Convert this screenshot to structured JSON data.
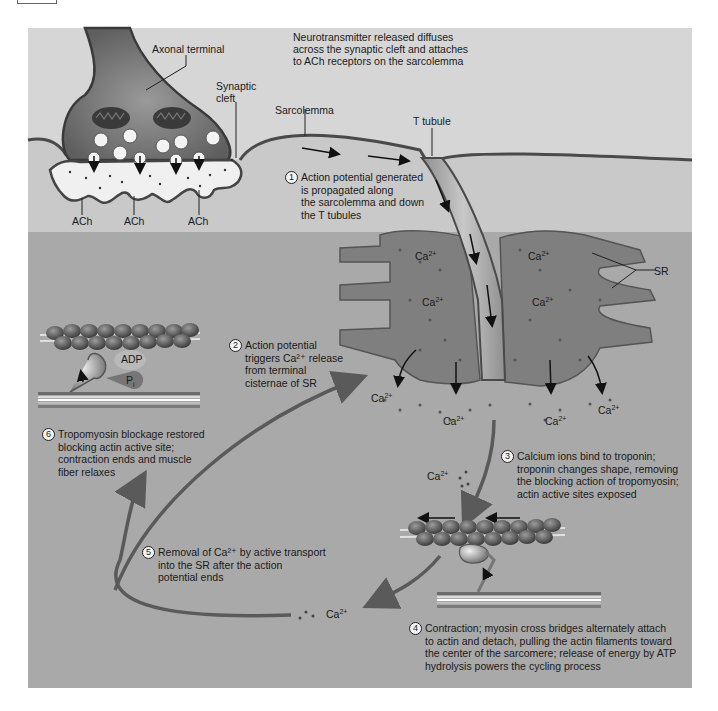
{
  "figure": {
    "colors": {
      "extracellular": "#d6d6d6",
      "cytoplasm": "#a9a9a9",
      "axon": "#6e6e6e",
      "sr": "#7a7a7a",
      "membrane": "#4a4a4a",
      "cycle_arrow": "#5a5a5a",
      "text": "#1a1a1a"
    }
  },
  "labels": {
    "axonal_terminal": "Axonal terminal",
    "synaptic_cleft_1": "Synaptic",
    "synaptic_cleft_2": "cleft",
    "sarcolemma": "Sarcolemma",
    "t_tubule": "T tubule",
    "sr": "SR",
    "ach": [
      "ACh",
      "ACh",
      "ACh"
    ],
    "adp": "ADP",
    "pi": "P",
    "pi_sub": "i",
    "ca": "Ca",
    "ca_charge": "2+"
  },
  "neurotransmitter_note": [
    "Neurotransmitter released diffuses",
    "across the synaptic cleft and attaches",
    "to ACh receptors on the sarcolemma"
  ],
  "steps": [
    {
      "num": "1",
      "lines": [
        "Action potential generated",
        "is propagated along",
        "the sarcolemma and down",
        "the T tubules"
      ]
    },
    {
      "num": "2",
      "lines": [
        "Action potential",
        "triggers Ca²⁺ release",
        "from terminal",
        "cisternae of SR"
      ]
    },
    {
      "num": "3",
      "lines": [
        "Calcium ions bind to troponin;",
        "troponin changes shape, removing",
        "the blocking action of tropomyosin;",
        "actin active sites exposed"
      ]
    },
    {
      "num": "4",
      "lines": [
        "Contraction; myosin cross bridges alternately attach",
        "to actin and detach, pulling the actin filaments toward",
        "the center of the sarcomere; release of energy by ATP",
        "hydrolysis powers the cycling process"
      ]
    },
    {
      "num": "5",
      "lines": [
        "Removal of Ca²⁺ by active transport",
        "into the SR after the action",
        "potential ends"
      ]
    },
    {
      "num": "6",
      "lines": [
        "Tropomyosin blockage restored",
        "blocking actin active site;",
        "contraction ends and muscle",
        "fiber relaxes"
      ]
    }
  ]
}
